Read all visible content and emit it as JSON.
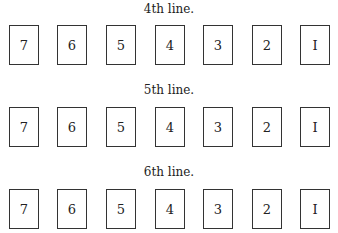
{
  "lines": [
    {
      "label": "4th line.",
      "cards": [
        "7",
        "6",
        "5",
        "4",
        "3",
        "2",
        "I"
      ]
    },
    {
      "label": "5th line.",
      "cards": [
        "7",
        "6",
        "5",
        "4",
        "3",
        "2",
        "I"
      ]
    },
    {
      "label": "6th line.",
      "cards": [
        "7",
        "6",
        "5",
        "4",
        "3",
        "2",
        "I"
      ]
    }
  ]
}
